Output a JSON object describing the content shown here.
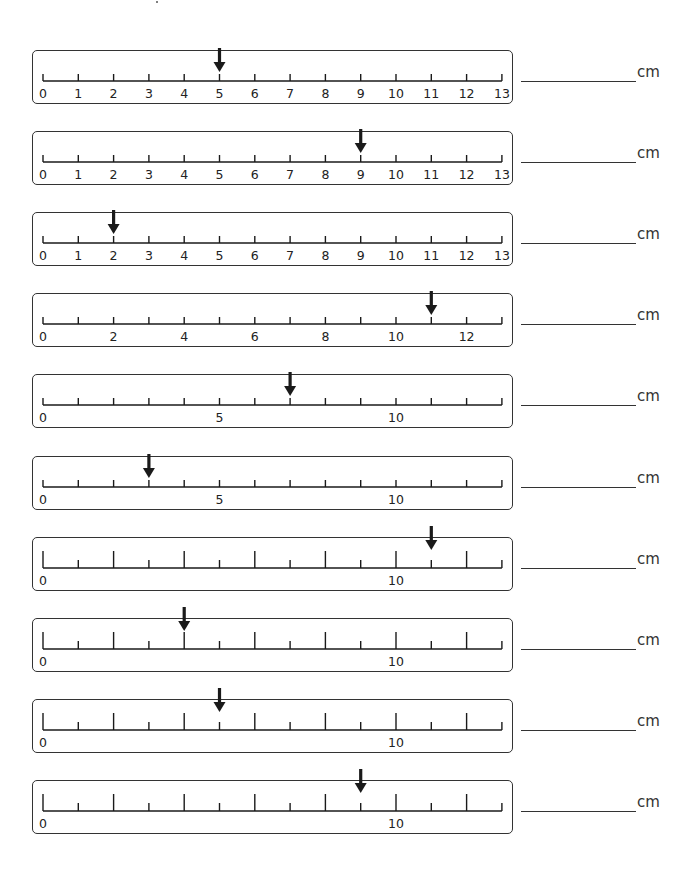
{
  "worksheet": {
    "unit": "cm",
    "scale": {
      "min": 0,
      "max": 13,
      "origin_x": 43,
      "px_per_unit": 35.3
    },
    "colors": {
      "ink": "#1a1a1a",
      "border": "#333333",
      "background": "#ffffff"
    },
    "rulers": [
      {
        "index": 1,
        "top": 38,
        "label_step": 1,
        "tick_style": "uniform",
        "arrow_at": 5,
        "labels": [
          "0",
          "1",
          "2",
          "3",
          "4",
          "5",
          "6",
          "7",
          "8",
          "9",
          "10",
          "11",
          "12",
          "13"
        ],
        "unit_label": "cm",
        "answer": ""
      },
      {
        "index": 2,
        "top": 119,
        "label_step": 1,
        "tick_style": "uniform",
        "arrow_at": 9,
        "labels": [
          "0",
          "1",
          "2",
          "3",
          "4",
          "5",
          "6",
          "7",
          "8",
          "9",
          "10",
          "11",
          "12",
          "13"
        ],
        "unit_label": "cm",
        "answer": ""
      },
      {
        "index": 3,
        "top": 200,
        "label_step": 1,
        "tick_style": "uniform",
        "arrow_at": 2,
        "labels": [
          "0",
          "1",
          "2",
          "3",
          "4",
          "5",
          "6",
          "7",
          "8",
          "9",
          "10",
          "11",
          "12",
          "13"
        ],
        "unit_label": "cm",
        "answer": ""
      },
      {
        "index": 4,
        "top": 281,
        "label_step": 2,
        "tick_style": "uniform",
        "arrow_at": 11,
        "labels": [
          "0",
          "2",
          "4",
          "6",
          "8",
          "10",
          "12"
        ],
        "unit_label": "cm",
        "answer": ""
      },
      {
        "index": 5,
        "top": 362,
        "label_step": 5,
        "tick_style": "uniform",
        "arrow_at": 7,
        "labels": [
          "0",
          "5",
          "10"
        ],
        "unit_label": "cm",
        "answer": ""
      },
      {
        "index": 6,
        "top": 444,
        "label_step": 5,
        "tick_style": "uniform",
        "arrow_at": 3,
        "labels": [
          "0",
          "5",
          "10"
        ],
        "unit_label": "cm",
        "answer": ""
      },
      {
        "index": 7,
        "top": 525,
        "label_step": 10,
        "tick_style": "even-long",
        "arrow_at": 11,
        "labels": [
          "0",
          "10"
        ],
        "unit_label": "cm",
        "answer": ""
      },
      {
        "index": 8,
        "top": 606,
        "label_step": 10,
        "tick_style": "even-long",
        "arrow_at": 4,
        "labels": [
          "0",
          "10"
        ],
        "unit_label": "cm",
        "answer": ""
      },
      {
        "index": 9,
        "top": 687,
        "label_step": 10,
        "tick_style": "even-long",
        "arrow_at": 5,
        "labels": [
          "0",
          "10"
        ],
        "unit_label": "cm",
        "answer": ""
      },
      {
        "index": 10,
        "top": 768,
        "label_step": 10,
        "tick_style": "even-long",
        "arrow_at": 9,
        "labels": [
          "0",
          "10"
        ],
        "unit_label": "cm",
        "answer": ""
      }
    ]
  }
}
